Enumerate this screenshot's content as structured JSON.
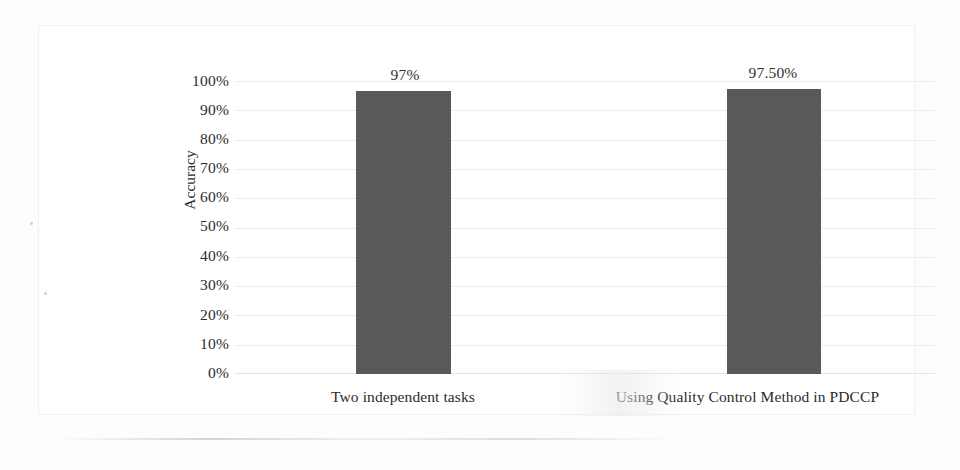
{
  "chart_data": {
    "type": "bar",
    "title": "",
    "subtitle": "",
    "xlabel": "",
    "ylabel": "Accuracy",
    "categories": [
      "Two independent tasks",
      "Using Quality Control Method in PDCCP"
    ],
    "values": [
      97,
      97.5
    ],
    "value_labels": [
      "97%",
      "97.50%"
    ],
    "ylim": [
      0,
      100
    ],
    "y_ticks": [
      100,
      90,
      80,
      70,
      60,
      50,
      40,
      30,
      20,
      10,
      0
    ],
    "y_tick_labels": [
      "100%",
      "90%",
      "80%",
      "70%",
      "60%",
      "50%",
      "40%",
      "30%",
      "20%",
      "10%",
      "0%"
    ],
    "grid": true,
    "grid_orientation": "horizontal",
    "legend": false,
    "legend_position": "none",
    "series": [
      {
        "name": "Accuracy",
        "values": [
          97,
          97.5
        ],
        "color": "#595959"
      }
    ],
    "colors": {
      "bar": "#595959",
      "gridline": "#ececec",
      "text": "#2c2c2c",
      "background": "#ffffff",
      "frame": "#f1f1f1"
    }
  }
}
